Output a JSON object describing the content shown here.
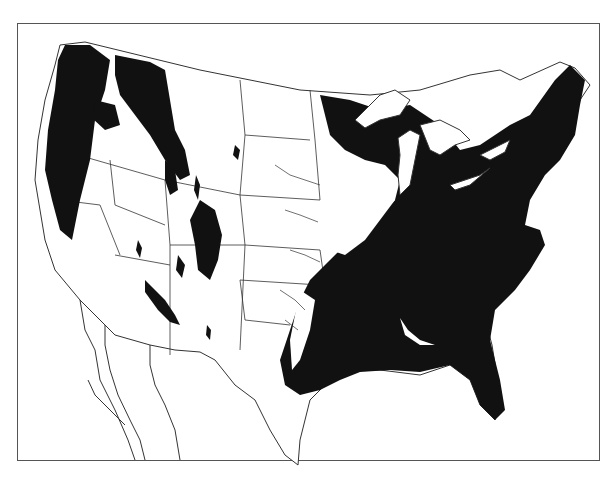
{
  "map": {
    "subject": "Contiguous United States forest cover distribution",
    "style": "black-and-white halftone",
    "colors": {
      "forest": "#111111",
      "land": "#ffffff",
      "boundaries": "#333333",
      "frame": "#555555"
    },
    "regions": [
      {
        "name": "pacific-northwest-forest",
        "type": "forest"
      },
      {
        "name": "northern-rockies-forest",
        "type": "forest"
      },
      {
        "name": "central-rockies-forest",
        "type": "forest"
      },
      {
        "name": "southwest-forest-patches",
        "type": "forest"
      },
      {
        "name": "eastern-forest",
        "type": "forest"
      },
      {
        "name": "great-lakes",
        "type": "water"
      },
      {
        "name": "gulf-of-mexico",
        "type": "water"
      },
      {
        "name": "mexico-baja",
        "type": "outline"
      }
    ]
  }
}
